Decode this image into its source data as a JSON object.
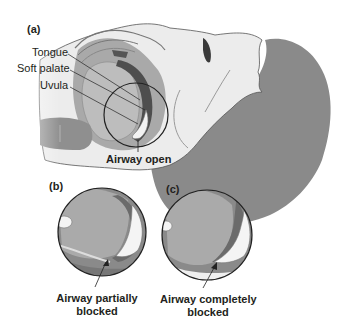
{
  "figure": {
    "colors": {
      "background": "#ffffff",
      "hair_skin_dark": "#8a8a8a",
      "tissue_mid": "#a9a9a9",
      "tissue_light": "#c8c8c8",
      "skin_light": "#ececec",
      "tongue_dark": "#5a5a5a",
      "outline": "#222222",
      "text": "#231f20"
    },
    "panels": [
      {
        "id": "a",
        "label": "(a)",
        "caption": "Airway open",
        "callouts": [
          "Tongue",
          "Soft palate",
          "Uvula"
        ]
      },
      {
        "id": "b",
        "label": "(b)",
        "caption_line1": "Airway partially",
        "caption_line2": "blocked"
      },
      {
        "id": "c",
        "label": "(c)",
        "caption_line1": "Airway completely",
        "caption_line2": "blocked"
      }
    ]
  }
}
